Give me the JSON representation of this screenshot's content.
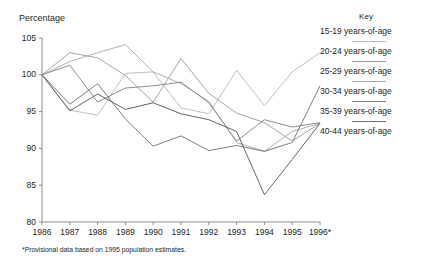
{
  "chart_data": {
    "type": "line",
    "title": "",
    "ylabel": "Percentage",
    "xlabel": "",
    "ylim": [
      80,
      105
    ],
    "yticks": [
      105,
      100,
      95,
      90,
      85,
      80
    ],
    "grid": false,
    "legend_position": "right",
    "legend_title": "Key",
    "categories": [
      "1986",
      "1987",
      "1988",
      "1989",
      "1990",
      "1991",
      "1992",
      "1993",
      "1994",
      "1995",
      "1996*"
    ],
    "x": [
      1986,
      1987,
      1988,
      1989,
      1990,
      1991,
      1992,
      1993,
      1994,
      1995,
      1996
    ],
    "series": [
      {
        "name": "15-19 years-of-age",
        "color": "#b9b9b9",
        "values": [
          100.0,
          95.2,
          94.5,
          100.2,
          100.4,
          95.5,
          94.7,
          100.6,
          95.8,
          100.4,
          103.0
        ]
      },
      {
        "name": "20-24 years-of-age",
        "color": "#9a9a9a",
        "values": [
          100.0,
          103.0,
          102.3,
          99.9,
          96.3,
          102.2,
          97.5,
          94.8,
          93.5,
          91.0,
          93.4
        ]
      },
      {
        "name": "25-29 years-of-age",
        "color": "#a8a8a8",
        "values": [
          100.0,
          101.8,
          103.0,
          104.1,
          100.4,
          98.8,
          96.4,
          90.8,
          89.6,
          92.3,
          93.4
        ]
      },
      {
        "name": "30-34 years-of-age",
        "color": "#818181",
        "values": [
          100.0,
          101.3,
          96.3,
          98.2,
          98.5,
          99.0,
          96.2,
          91.0,
          93.9,
          92.9,
          93.5
        ]
      },
      {
        "name": "35-39 years-of-age",
        "color": "#6d6d6d",
        "values": [
          100.0,
          96.0,
          98.8,
          94.0,
          90.3,
          91.7,
          89.7,
          90.4,
          89.6,
          90.8,
          98.5
        ]
      },
      {
        "name": "40-44 years-of-age",
        "color": "#545454",
        "values": [
          100.0,
          95.1,
          97.4,
          95.3,
          96.2,
          94.7,
          93.9,
          92.3,
          83.7,
          88.5,
          93.4
        ]
      }
    ],
    "axis_color": "#8c8c8c",
    "footnote": "*Provisional data based on 1995 population estimates."
  },
  "legend": {
    "title": "Key",
    "items": [
      {
        "label": "15-19 years-of-age"
      },
      {
        "label": "20-24 years-of-age"
      },
      {
        "label": "25-29 years-of-age"
      },
      {
        "label": "30-34 years-of-age"
      },
      {
        "label": "35-39 years-of-age"
      },
      {
        "label": "40-44 years-of-age"
      }
    ]
  }
}
